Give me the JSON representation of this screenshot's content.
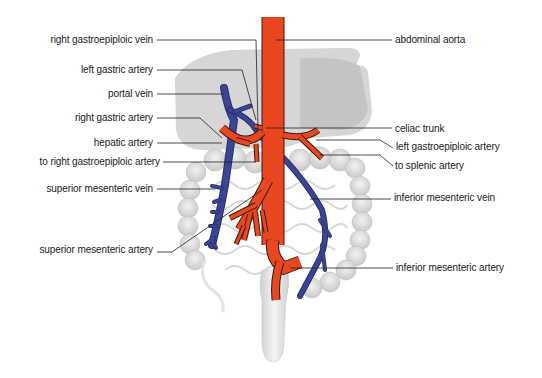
{
  "diagram": {
    "colors": {
      "artery": "#e8471f",
      "vein": "#3a4694",
      "organ": "#d4d4d4",
      "organ_dark": "#bdbdbd",
      "leader": "#222222",
      "text": "#1a1a1a"
    },
    "labels_left": [
      {
        "id": "right-gastroepiploic-vein",
        "text": "right gastroepiploic vein",
        "x": 154,
        "y": 40
      },
      {
        "id": "left-gastric-artery",
        "text": "left gastric artery",
        "x": 154,
        "y": 70
      },
      {
        "id": "portal-vein",
        "text": "portal vein",
        "x": 154,
        "y": 94
      },
      {
        "id": "right-gastric-artery",
        "text": "right gastric artery",
        "x": 154,
        "y": 118
      },
      {
        "id": "hepatic-artery",
        "text": "hepatic artery",
        "x": 154,
        "y": 143
      },
      {
        "id": "to-right-gastroepiploic-artery",
        "text": "to right gastroepiploic artery",
        "x": 160,
        "y": 162
      },
      {
        "id": "superior-mesenteric-vein",
        "text": "superior mesenteric vein",
        "x": 154,
        "y": 189
      },
      {
        "id": "superior-mesenteric-artery",
        "text": "superior mesenteric artery",
        "x": 152,
        "y": 250
      }
    ],
    "labels_right": [
      {
        "id": "abdominal-aorta",
        "text": "abdominal aorta",
        "x": 395,
        "y": 40
      },
      {
        "id": "celiac-trunk",
        "text": "celiac trunk",
        "x": 395,
        "y": 129
      },
      {
        "id": "left-gastroepiploic-artery",
        "text": "left gastroepiploic artery",
        "x": 397,
        "y": 146
      },
      {
        "id": "to-splenic-artery",
        "text": "to splenic artery",
        "x": 396,
        "y": 165
      },
      {
        "id": "inferior-mesenteric-vein",
        "text": "inferior mesenteric vein",
        "x": 394,
        "y": 197
      },
      {
        "id": "inferior-mesenteric-artery",
        "text": "inferior mesenteric artery",
        "x": 396,
        "y": 268
      }
    ]
  }
}
